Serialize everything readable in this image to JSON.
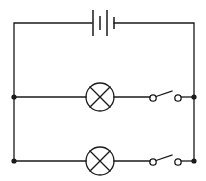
{
  "diagram": {
    "type": "electric-circuit",
    "colors": {
      "line": "#1a1a1a",
      "background": "#ffffff"
    },
    "components": [
      {
        "id": "battery",
        "kind": "battery",
        "cells": 2
      },
      {
        "id": "lamp-1",
        "kind": "lamp",
        "branch": 1
      },
      {
        "id": "switch-1",
        "kind": "switch",
        "state": "open",
        "branch": 1
      },
      {
        "id": "lamp-2",
        "kind": "lamp",
        "branch": 2
      },
      {
        "id": "switch-2",
        "kind": "switch",
        "state": "open",
        "branch": 2
      }
    ],
    "junctions": 4
  }
}
